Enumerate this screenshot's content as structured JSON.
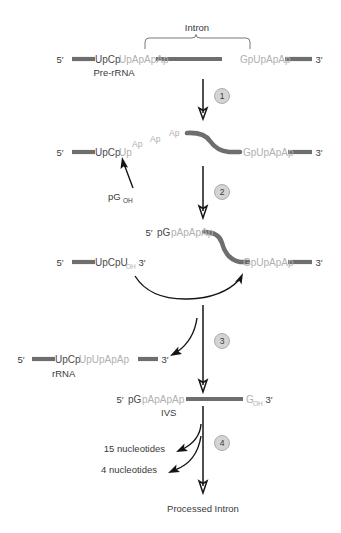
{
  "figure": {
    "title_intron": "Intron",
    "final_label": "Processed Intron"
  },
  "rows": {
    "pre_rrna": {
      "five_prime": "5′",
      "exon1_dark": "UpCp",
      "exon1_light": "UpApApAp",
      "exon2_light": "GpUpApAp",
      "three_prime": "3′",
      "name": "Pre-rRNA"
    },
    "step1_product": {
      "five_prime": "5′",
      "seq_dark": "UpCp",
      "seq_light": "Up",
      "diag1": "Ap",
      "diag2": "Ap",
      "diag3": "Ap",
      "right_light": "GpUpApAp",
      "three_prime": "3′"
    },
    "cofactor": {
      "label": "pG",
      "subscript": "OH"
    },
    "step2_product_top": {
      "five_prime": "5′",
      "seq_dark": "pG",
      "seq_light": "pApApAp"
    },
    "step2_left_fragment": {
      "five_prime": "5′",
      "seq_dark": "UpCpU",
      "subscript": "OH",
      "three_prime": "3′"
    },
    "step2_right_fragment": {
      "seq_light": "GpUpApAp",
      "three_prime": "3′"
    },
    "rrna": {
      "five_prime": "5′",
      "seq_dark": "UpCp",
      "seq_light": "UpUpApAp",
      "three_prime": "3′",
      "name": "rRNA"
    },
    "ivs": {
      "five_prime": "5′",
      "seq_dark": "pG",
      "seq_light": "pApApAp",
      "end_base": "G",
      "end_subscript": "OH",
      "three_prime": "3′",
      "name": "IVS"
    }
  },
  "steps": [
    {
      "id": "1",
      "label": "1"
    },
    {
      "id": "2",
      "label": "2"
    },
    {
      "id": "3",
      "label": "3"
    },
    {
      "id": "4",
      "label": "4"
    }
  ],
  "products": {
    "frag_15": "15 nucleotides",
    "frag_4": "4 nucleotides"
  },
  "colors": {
    "rna_backbone": "#6e6e6e",
    "sequence_dark": "#4a4a4a",
    "sequence_light": "#b0b0b0",
    "text": "#3a3a3a",
    "arrow": "#151515",
    "step_badge_fill": "#d4d4d4",
    "background": "#ffffff"
  }
}
